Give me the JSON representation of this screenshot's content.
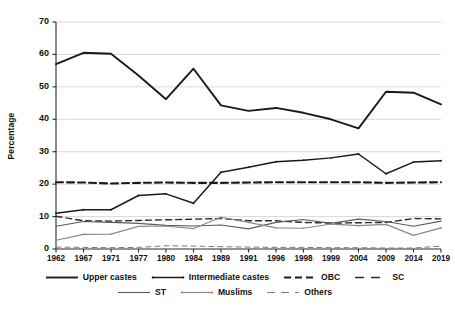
{
  "chart_data": {
    "type": "line",
    "title": "",
    "xlabel": "",
    "ylabel": "Percentage",
    "ylim": [
      0,
      70
    ],
    "ytick_values": [
      0,
      10,
      20,
      30,
      40,
      50,
      60,
      70
    ],
    "grid": true,
    "legend_position": "bottom",
    "categories": [
      "1962",
      "1967",
      "1971",
      "1977",
      "1980",
      "1984",
      "1989",
      "1991",
      "1996",
      "1998",
      "1999",
      "2004",
      "2009",
      "2014",
      "2019"
    ],
    "series": [
      {
        "name": "Upper castes",
        "style": "solid",
        "color": "#1a1a1a",
        "width": 1.9,
        "values": [
          57.0,
          60.5,
          60.2,
          53.5,
          46.2,
          55.6,
          44.3,
          42.6,
          43.5,
          42.0,
          40.0,
          37.2,
          48.5,
          48.2,
          44.6
        ]
      },
      {
        "name": "Intermediate castes",
        "style": "solid-dot",
        "color": "#1a1a1a",
        "width": 1.5,
        "values": [
          11.0,
          12.1,
          12.1,
          16.5,
          17.0,
          14.1,
          23.7,
          25.2,
          26.9,
          27.4,
          28.1,
          29.3,
          23.2,
          26.8,
          27.2
        ]
      },
      {
        "name": "OBC",
        "style": "dashed-thick",
        "color": "#1a1a1a",
        "width": 2.1,
        "values": [
          20.6,
          20.5,
          20.2,
          20.4,
          20.5,
          20.4,
          20.4,
          20.5,
          20.6,
          20.6,
          20.6,
          20.6,
          20.4,
          20.5,
          20.6
        ]
      },
      {
        "name": "SC",
        "style": "dashed",
        "color": "#2b2b2b",
        "width": 1.4,
        "values": [
          10.1,
          8.7,
          8.6,
          8.8,
          9.0,
          9.2,
          9.4,
          8.7,
          8.7,
          8.2,
          8.0,
          8.1,
          8.2,
          9.4,
          9.3
        ]
      },
      {
        "name": "ST",
        "style": "solid-thin",
        "color": "#5a5a5a",
        "width": 1.1,
        "values": [
          7.0,
          8.5,
          8.2,
          7.9,
          7.3,
          7.1,
          7.4,
          6.2,
          8.2,
          9.1,
          7.9,
          9.2,
          8.5,
          7.0,
          8.6
        ]
      },
      {
        "name": "Muslims",
        "style": "solid-dot-thin",
        "color": "#8a8a8a",
        "width": 1.2,
        "values": [
          2.7,
          4.5,
          4.6,
          7.0,
          7.1,
          6.3,
          9.8,
          8.2,
          6.5,
          6.4,
          7.7,
          7.2,
          7.6,
          4.2,
          6.5
        ]
      },
      {
        "name": "Others",
        "style": "dashed-thin",
        "color": "#7a7a7a",
        "width": 1.0,
        "values": [
          0.6,
          0.5,
          0.4,
          0.5,
          1.0,
          0.9,
          0.7,
          0.6,
          0.5,
          0.5,
          0.4,
          0.4,
          0.3,
          0.3,
          0.9
        ]
      }
    ]
  },
  "legend": {
    "rows": [
      [
        {
          "label": "Upper castes",
          "key": "solid"
        },
        {
          "label": "Intermediate castes",
          "key": "solid-dot"
        },
        {
          "label": "OBC",
          "key": "dashed-thick"
        },
        {
          "label": "SC",
          "key": "dashed"
        }
      ],
      [
        {
          "label": "ST",
          "key": "solid-thin"
        },
        {
          "label": "Muslims",
          "key": "solid-dot-thin"
        },
        {
          "label": "Others",
          "key": "dashed-thin"
        }
      ]
    ]
  }
}
